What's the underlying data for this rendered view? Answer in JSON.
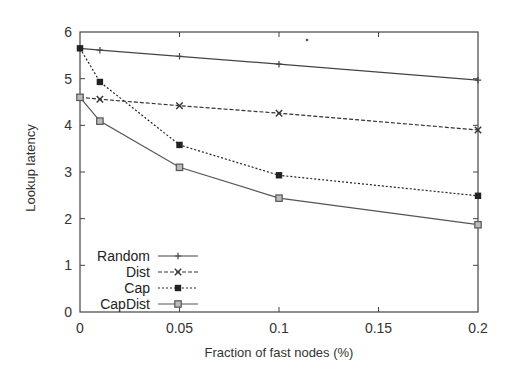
{
  "chart_data": {
    "type": "line",
    "title": "",
    "xlabel": "Fraction of fast nodes (%)",
    "ylabel": "Lookup latency",
    "x": [
      0,
      0.01,
      0.05,
      0.1,
      0.2
    ],
    "xlim": [
      0,
      0.2
    ],
    "ylim": [
      0,
      6
    ],
    "xticks": [
      0,
      0.05,
      0.1,
      0.15,
      0.2
    ],
    "xtick_labels": [
      "0",
      "0.05",
      "0.1",
      "0.15",
      "0.2"
    ],
    "yticks": [
      0,
      1,
      2,
      3,
      4,
      5,
      6
    ],
    "ytick_labels": [
      "0",
      "1",
      "2",
      "3",
      "4",
      "5",
      "6"
    ],
    "grid": false,
    "legend_position": "lower left",
    "series": [
      {
        "name": "Random",
        "values": [
          5.65,
          5.61,
          5.48,
          5.31,
          4.97
        ],
        "line": "solid",
        "marker": "plus",
        "color": "#444444"
      },
      {
        "name": "Dist",
        "values": [
          4.6,
          4.56,
          4.42,
          4.26,
          3.9
        ],
        "line": "dashed",
        "marker": "cross",
        "color": "#333333"
      },
      {
        "name": "Cap",
        "values": [
          5.65,
          4.93,
          3.58,
          2.93,
          2.49
        ],
        "line": "dotted",
        "marker": "filled-square",
        "color": "#222222"
      },
      {
        "name": "CapDist",
        "values": [
          4.6,
          4.09,
          3.1,
          2.44,
          1.87
        ],
        "line": "solid",
        "marker": "open-square",
        "color": "#555555"
      }
    ]
  }
}
